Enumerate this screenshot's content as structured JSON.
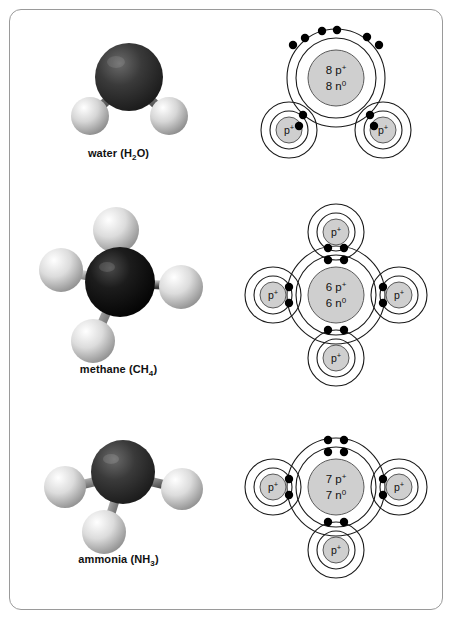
{
  "figure": {
    "type": "diagram",
    "border_color": "#9a9a9a",
    "background": "#ffffff"
  },
  "palette": {
    "heavy_atom_dark": "#2e2e2e",
    "heavy_atom_black": "#0d0d0d",
    "hydrogen_light": "#d8d8d8",
    "shell_line": "#1a1a1a",
    "nucleus_fill": "#cfcfcf",
    "electron_dot": "#000000"
  },
  "molecules": [
    {
      "id": "water",
      "caption_name": "water",
      "caption_formula_main": "H",
      "caption_formula_sub": "2",
      "caption_formula_tail": "O",
      "caption_full": "water (H2O)",
      "model": {
        "central_atom_color": "#2e2e2e",
        "central_atom_label": "O",
        "hydrogen_count": 2,
        "geometry": "bent"
      },
      "bohr": {
        "nucleus_line1_count": "8",
        "nucleus_line1_symbol": "p",
        "nucleus_line1_charge": "+",
        "nucleus_line2_count": "8",
        "nucleus_line2_symbol": "n",
        "nucleus_line2_charge": "0",
        "nucleus_line1": "8 p+",
        "nucleus_line2": "8 n0",
        "shell_count": 2,
        "hydrogen_label": "p",
        "hydrogen_charge": "+",
        "hydrogen_count": 2,
        "bonding_pairs": 2,
        "lone_pairs": 2
      }
    },
    {
      "id": "methane",
      "caption_name": "methane",
      "caption_formula_main": "CH",
      "caption_formula_sub": "4",
      "caption_formula_tail": "",
      "caption_full": "methane (CH4)",
      "model": {
        "central_atom_color": "#0d0d0d",
        "central_atom_label": "C",
        "hydrogen_count": 4,
        "geometry": "tetrahedral"
      },
      "bohr": {
        "nucleus_line1_count": "6",
        "nucleus_line1_symbol": "p",
        "nucleus_line1_charge": "+",
        "nucleus_line2_count": "6",
        "nucleus_line2_symbol": "n",
        "nucleus_line2_charge": "0",
        "nucleus_line1": "6 p+",
        "nucleus_line2": "6 n0",
        "shell_count": 2,
        "hydrogen_label": "p",
        "hydrogen_charge": "+",
        "hydrogen_count": 4,
        "bonding_pairs": 4,
        "lone_pairs": 0
      }
    },
    {
      "id": "ammonia",
      "caption_name": "ammonia",
      "caption_formula_main": "NH",
      "caption_formula_sub": "3",
      "caption_formula_tail": "",
      "caption_full": "ammonia (NH3)",
      "model": {
        "central_atom_color": "#2e2e2e",
        "central_atom_label": "N",
        "hydrogen_count": 3,
        "geometry": "trigonal-pyramidal"
      },
      "bohr": {
        "nucleus_line1_count": "7",
        "nucleus_line1_symbol": "p",
        "nucleus_line1_charge": "+",
        "nucleus_line2_count": "7",
        "nucleus_line2_symbol": "n",
        "nucleus_line2_charge": "0",
        "nucleus_line1": "7 p+",
        "nucleus_line2": "7 n0",
        "shell_count": 2,
        "hydrogen_label": "p",
        "hydrogen_charge": "+",
        "hydrogen_count": 3,
        "bonding_pairs": 3,
        "lone_pairs": 1
      }
    }
  ]
}
